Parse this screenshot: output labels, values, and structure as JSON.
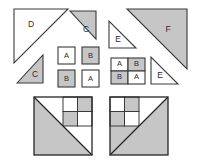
{
  "figure": {
    "background_color": "#ffffff",
    "fill_gray": "#c6c6c6",
    "fill_white": "#ffffff",
    "stroke_color": "#3a3a3a",
    "stroke_dark": "#262626",
    "label_color": "#2b2b2b"
  },
  "groups": {
    "left_pieces": {
      "name": "Left piece set",
      "triangles": [
        {
          "label": "D",
          "fill": "white",
          "right_angle": "bottom-left"
        },
        {
          "label": "C",
          "fill": "gray",
          "right_angle": "bottom-right"
        },
        {
          "label": "C",
          "fill": "gray",
          "right_angle": "bottom-right"
        }
      ],
      "squares": [
        {
          "label": "A",
          "fill": "white"
        },
        {
          "label": "B",
          "fill": "gray"
        },
        {
          "label": "B",
          "fill": "gray"
        },
        {
          "label": "A",
          "fill": "white"
        }
      ]
    },
    "right_pieces": {
      "name": "Right piece set",
      "triangles": [
        {
          "label": "E",
          "fill": "white",
          "right_angle": "bottom-left"
        },
        {
          "label": "F",
          "fill": "gray",
          "right_angle": "top-right"
        },
        {
          "label": "E",
          "fill": "white",
          "right_angle": "bottom-left"
        }
      ],
      "squares": [
        {
          "label": "A",
          "fill": "white"
        },
        {
          "label": "B",
          "fill": "gray"
        },
        {
          "label": "B",
          "fill": "gray"
        },
        {
          "label": "A",
          "fill": "white"
        }
      ]
    },
    "bottom_left_composite": {
      "name": "Left composite square",
      "diagonal": "top-left to bottom-right",
      "large_triangle_fill": "gray",
      "upper_triangle_fill": "white",
      "inner_block_position": "top-right",
      "inner_cells": [
        "white",
        "gray",
        "gray",
        "white"
      ],
      "side_strip_fill": "gray"
    },
    "bottom_right_composite": {
      "name": "Right composite square",
      "diagonal": "top-right to bottom-left",
      "large_triangle_fill": "gray",
      "upper_triangle_fill": "white",
      "inner_block_position": "top-left",
      "inner_cells": [
        "white",
        "gray",
        "gray",
        "white"
      ],
      "side_strip_fill": "gray"
    }
  },
  "labels": {
    "d": "D",
    "c_top": "C",
    "c_bottom": "C",
    "e_top": "E",
    "f": "F",
    "e_bottom": "E",
    "left_sq_a1": "A",
    "left_sq_b1": "B",
    "left_sq_b2": "B",
    "left_sq_a2": "A",
    "right_sq_a1": "A",
    "right_sq_b1": "B",
    "right_sq_b2": "B",
    "right_sq_a2": "A"
  }
}
